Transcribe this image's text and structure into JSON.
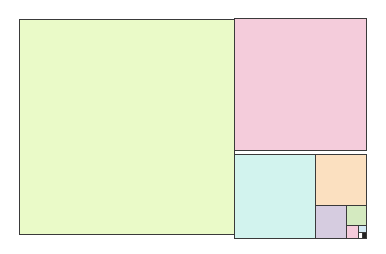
{
  "diagram": {
    "type": "fibonacci-square-tiling",
    "outline_color": "#3a3a3a",
    "squares": [
      {
        "name": "square-1",
        "x": 19,
        "y": 19,
        "size": 216,
        "color": "#eafac8"
      },
      {
        "name": "square-2",
        "x": 234,
        "y": 18,
        "size": 133,
        "color": "#f4ccdb"
      },
      {
        "name": "square-3",
        "x": 234,
        "y": 154,
        "w": 82,
        "h": 85,
        "color": "#d2f3ee"
      },
      {
        "name": "square-4",
        "x": 315,
        "y": 154,
        "w": 52,
        "h": 52,
        "color": "#fbe0c0"
      },
      {
        "name": "square-5",
        "x": 315,
        "y": 205,
        "w": 32,
        "h": 34,
        "color": "#d6cce0"
      },
      {
        "name": "square-6",
        "x": 346,
        "y": 205,
        "w": 21,
        "h": 21,
        "color": "#d4eac0"
      },
      {
        "name": "square-7",
        "x": 346,
        "y": 225,
        "w": 13,
        "h": 14,
        "color": "#f6ccdc"
      },
      {
        "name": "square-8",
        "x": 358,
        "y": 225,
        "w": 9,
        "h": 8,
        "color": "#d4eaf4"
      },
      {
        "name": "square-9",
        "x": 358,
        "y": 232,
        "w": 5,
        "h": 7,
        "color": "#ffffff"
      },
      {
        "name": "square-10",
        "x": 362,
        "y": 232,
        "w": 5,
        "h": 7,
        "color": "#222222"
      }
    ]
  }
}
